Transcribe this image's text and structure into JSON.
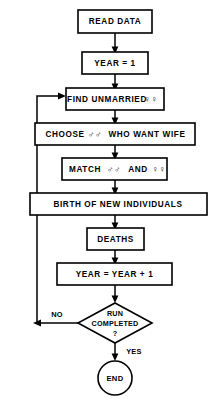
{
  "diagram": {
    "type": "flowchart",
    "colors": {
      "background": "#ffffff",
      "stroke": "#000000",
      "text": "#000000"
    },
    "nodes": [
      {
        "id": "read-data",
        "shape": "rectangle",
        "label": "READ DATA"
      },
      {
        "id": "year-init",
        "shape": "rectangle",
        "label": "YEAR = 1"
      },
      {
        "id": "find-unmarried",
        "shape": "rectangle",
        "label": "FIND UNMARRIED",
        "symbol": "♀♀",
        "symbol_name": "female-female-symbol"
      },
      {
        "id": "choose-males",
        "shape": "rectangle",
        "label_before": "CHOOSE",
        "symbol": "♂♂",
        "symbol_name": "male-male-symbol",
        "label_after": "WHO WANT WIFE"
      },
      {
        "id": "match",
        "shape": "rectangle",
        "label_before": "MATCH",
        "symbol": "♂♂",
        "symbol_name": "male-male-symbol",
        "label_mid": "AND",
        "symbol2": "♀♀",
        "symbol2_name": "female-female-symbol"
      },
      {
        "id": "birth",
        "shape": "rectangle",
        "label": "BIRTH OF NEW  INDIVIDUALS"
      },
      {
        "id": "deaths",
        "shape": "rectangle",
        "label": "DEATHS"
      },
      {
        "id": "year-increment",
        "shape": "rectangle",
        "label": "YEAR =  YEAR + 1"
      },
      {
        "id": "run-completed",
        "shape": "diamond",
        "line1": "RUN",
        "line2": "COMPLETED",
        "line3": "?"
      },
      {
        "id": "end",
        "shape": "circle",
        "label": "END"
      }
    ],
    "edge_labels": {
      "no": "NO",
      "yes": "YES"
    }
  }
}
